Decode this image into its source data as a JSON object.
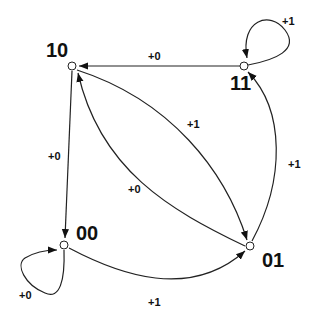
{
  "diagram": {
    "type": "state-diagram",
    "nodes": [
      {
        "id": "10",
        "label": "10"
      },
      {
        "id": "11",
        "label": "11"
      },
      {
        "id": "00",
        "label": "00"
      },
      {
        "id": "01",
        "label": "01"
      }
    ],
    "edges": [
      {
        "from": "11",
        "to": "10",
        "label": "+0"
      },
      {
        "from": "11",
        "to": "11",
        "label": "+1"
      },
      {
        "from": "10",
        "to": "01",
        "label": "+1"
      },
      {
        "from": "01",
        "to": "10",
        "label": "+0"
      },
      {
        "from": "10",
        "to": "00",
        "label": "+0"
      },
      {
        "from": "00",
        "to": "00",
        "label": "+0"
      },
      {
        "from": "00",
        "to": "01",
        "label": "+1"
      },
      {
        "from": "01",
        "to": "11",
        "label": "+1"
      }
    ],
    "colors": {
      "stroke": "#222222",
      "background": "#ffffff"
    }
  }
}
